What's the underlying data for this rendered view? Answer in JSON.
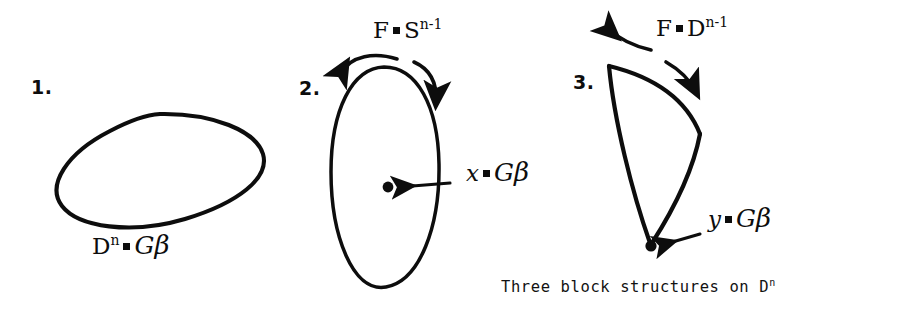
{
  "page": {
    "background_color": "#ffffff",
    "ink_color": "#0d0d0d",
    "caption": {
      "text": "Three block structures on D",
      "superscript": "n",
      "full_text": "Three block structures on D^n"
    }
  },
  "figures": [
    {
      "number": "1.",
      "shape": "tilted-ellipse",
      "label": {
        "base": "D",
        "exponent": "n",
        "relation": "=",
        "target_gothic": "G",
        "target_beta": "β",
        "full_text": "D^n = Gβ"
      },
      "annotations": []
    },
    {
      "number": "2.",
      "shape": "vertical-ellipse-with-center-dot",
      "label": {
        "base": "x",
        "relation": "=",
        "target_gothic": "G",
        "target_beta": "β",
        "full_text": "x = Gβ"
      },
      "annotations": [
        {
          "name": "fiber-label",
          "base": "F",
          "relation": "=",
          "target": "S",
          "exponent": "n-1",
          "full_text": "F = S^(n-1)"
        }
      ]
    },
    {
      "number": "3.",
      "shape": "curved-wedge-with-apex-dot",
      "label": {
        "base": "y",
        "relation": "=",
        "target_gothic": "G",
        "target_beta": "β",
        "full_text": "y = Gβ"
      },
      "annotations": [
        {
          "name": "fiber-label",
          "base": "F",
          "relation": "=",
          "target": "D",
          "exponent": "n-1",
          "full_text": "F = D^(n-1)"
        }
      ]
    }
  ]
}
